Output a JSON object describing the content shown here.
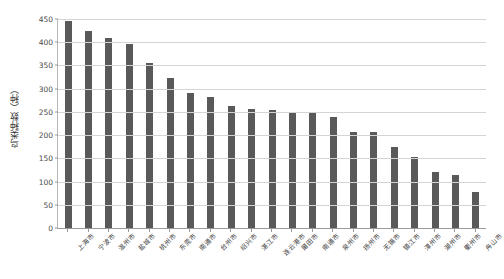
{
  "chart_data": {
    "type": "bar",
    "title": "",
    "xlabel": "",
    "ylabel": "鸟类种数（种）",
    "ylim": [
      0,
      450
    ],
    "ytick_step": 50,
    "yticks": [
      0,
      50,
      100,
      150,
      200,
      250,
      300,
      350,
      400,
      450
    ],
    "grid": true,
    "legend": false,
    "bar_color": "#595959",
    "gridline_color": "#d4d4d4",
    "axis_color": "#9a9a9a",
    "categories": [
      "上海市",
      "宁波市",
      "温州市",
      "盐城市",
      "杭州市",
      "东莞市",
      "南通市",
      "台州市",
      "绍兴市",
      "湛江市",
      "连云港市",
      "莆田市",
      "南通市",
      "泉州市",
      "扬州市",
      "无锡市",
      "镇江市",
      "漳州市",
      "湖州市",
      "衢州市",
      "舟山市"
    ],
    "values": [
      446,
      425,
      409,
      397,
      355,
      322,
      290,
      283,
      263,
      256,
      254,
      250,
      248,
      238,
      206,
      206,
      175,
      152,
      120,
      115,
      77
    ]
  }
}
